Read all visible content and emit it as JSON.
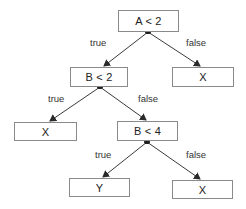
{
  "diagram": {
    "type": "decision-tree",
    "colors": {
      "line": "#3a3a3a",
      "box_border": "#8a8a8a",
      "text": "#222222"
    },
    "nodes": [
      {
        "id": "n1",
        "label": "A < 2",
        "kind": "decision"
      },
      {
        "id": "n2",
        "label": "B < 2",
        "kind": "decision"
      },
      {
        "id": "n3",
        "label": "X",
        "kind": "leaf"
      },
      {
        "id": "n4",
        "label": "X",
        "kind": "leaf"
      },
      {
        "id": "n5",
        "label": "B < 4",
        "kind": "decision"
      },
      {
        "id": "n6",
        "label": "Y",
        "kind": "leaf"
      },
      {
        "id": "n7",
        "label": "X",
        "kind": "leaf"
      }
    ],
    "edges": [
      {
        "from": "n1",
        "to": "n2",
        "label": "true"
      },
      {
        "from": "n1",
        "to": "n3",
        "label": "false"
      },
      {
        "from": "n2",
        "to": "n4",
        "label": "true"
      },
      {
        "from": "n2",
        "to": "n5",
        "label": "false"
      },
      {
        "from": "n5",
        "to": "n6",
        "label": "true"
      },
      {
        "from": "n5",
        "to": "n7",
        "label": "false"
      }
    ]
  }
}
